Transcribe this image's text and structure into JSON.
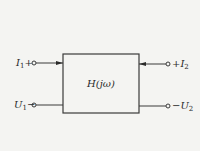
{
  "diagram": {
    "type": "two-port network block diagram",
    "block": {
      "label": "H(jω)"
    },
    "ports": {
      "input": {
        "top_terminal": {
          "symbol": "I",
          "subscript": "1",
          "sign": "+"
        },
        "bottom_terminal": {
          "symbol": "U",
          "subscript": "1",
          "sign": "−"
        }
      },
      "output": {
        "top_terminal": {
          "symbol": "I",
          "subscript": "2",
          "sign": "+"
        },
        "bottom_terminal": {
          "symbol": "U",
          "subscript": "2",
          "sign": "−"
        }
      }
    },
    "colors": {
      "line": "#3a3a3a",
      "background": "#f4f4f2"
    }
  }
}
